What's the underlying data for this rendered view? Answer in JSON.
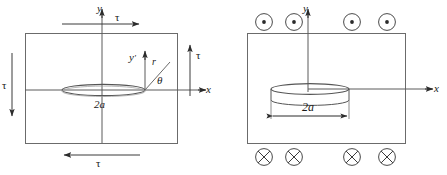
{
  "figure": {
    "type": "technical-diagram",
    "background_color": "#ffffff",
    "line_color": "#4d4d4d",
    "text_color": "#1a1a1a"
  },
  "panels": [
    {
      "id": "left",
      "name": "shear-loaded-crack-panel",
      "body": {
        "name": "rectangular-body",
        "shape": "rectangle"
      },
      "axes": [
        {
          "name": "y-axis",
          "label": "y",
          "direction": "up"
        },
        {
          "name": "x-axis",
          "label": "x",
          "direction": "right"
        },
        {
          "name": "y-prime-axis",
          "label": "y",
          "prime": "'",
          "direction": "up"
        }
      ],
      "crack": {
        "name": "penny-shaped-crack",
        "shape": "flat-ellipse",
        "dimension_label": "2a"
      },
      "polar": {
        "radius_label": "r",
        "angle_label": "θ"
      },
      "loads": [
        {
          "name": "shear-arrow-top",
          "label": "τ",
          "direction": "right"
        },
        {
          "name": "shear-arrow-right",
          "label": "τ",
          "direction": "up"
        },
        {
          "name": "shear-arrow-bottom",
          "label": "τ",
          "direction": "left"
        },
        {
          "name": "shear-arrow-left",
          "label": "τ",
          "direction": "down"
        }
      ]
    },
    {
      "id": "right",
      "name": "antiplane-loaded-disk-panel",
      "body": {
        "name": "rectangular-body",
        "shape": "rectangle"
      },
      "axes": [
        {
          "name": "y-axis",
          "label": "y",
          "direction": "up"
        },
        {
          "name": "x-axis",
          "label": "x",
          "direction": "right"
        }
      ],
      "disk": {
        "name": "disk-shaped-inclusion",
        "shape": "3d-disk",
        "dimension_label": "2a",
        "dimension_style": "double-headed-arrow"
      },
      "markers_top": {
        "name": "out-of-page-markers",
        "glyph": "⊙",
        "count": 4,
        "meaning": "out of page"
      },
      "markers_bottom": {
        "name": "into-page-markers",
        "glyph": "⊗",
        "count": 4,
        "meaning": "into page"
      }
    }
  ]
}
